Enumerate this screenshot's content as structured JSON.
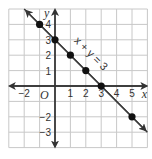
{
  "chart_data": {
    "type": "line",
    "title": "",
    "xlabel": "x",
    "ylabel": "y",
    "origin_label": "O",
    "equation_label": "x + y = 3",
    "xlim": [
      -3,
      6
    ],
    "ylim": [
      -4,
      5
    ],
    "grid": true,
    "x_ticks": [
      -2,
      1,
      2,
      3,
      4,
      5
    ],
    "x_tick_labels": [
      "−2",
      "1",
      "2",
      "3",
      "4",
      "5"
    ],
    "y_ticks": [
      4,
      3,
      2,
      1,
      -2,
      -3
    ],
    "y_tick_labels": [
      "4",
      "3",
      "2",
      "1",
      "−2",
      "−3"
    ],
    "series": [
      {
        "name": "x + y = 3",
        "points": [
          [
            -1,
            4
          ],
          [
            0,
            3
          ],
          [
            1,
            2
          ],
          [
            2,
            1
          ],
          [
            3,
            0
          ],
          [
            5,
            -2
          ]
        ],
        "line_extends": [
          [
            -2,
            5
          ],
          [
            6,
            -3
          ]
        ]
      }
    ],
    "colors": {
      "grid": "#c8c8c8",
      "axis": "#333333",
      "line": "#3a3a3a",
      "point": "#111111"
    }
  }
}
